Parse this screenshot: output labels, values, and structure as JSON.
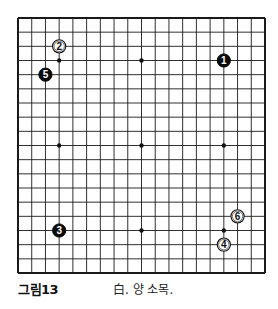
{
  "board": {
    "size": 19,
    "origin": {
      "x": 18,
      "y": 18
    },
    "end": {
      "x": 265,
      "y": 273
    },
    "line_color": "#1a1a1a",
    "background": "#ffffff",
    "star_points": [
      [
        3,
        3
      ],
      [
        3,
        9
      ],
      [
        3,
        15
      ],
      [
        9,
        3
      ],
      [
        9,
        9
      ],
      [
        9,
        15
      ],
      [
        15,
        3
      ],
      [
        15,
        9
      ],
      [
        15,
        15
      ]
    ],
    "stones": [
      {
        "number": "1",
        "color": "black",
        "col": 15,
        "row": 3
      },
      {
        "number": "2",
        "color": "white",
        "col": 3,
        "row": 2
      },
      {
        "number": "3",
        "color": "black",
        "col": 3,
        "row": 15
      },
      {
        "number": "4",
        "color": "white",
        "col": 15,
        "row": 16
      },
      {
        "number": "5",
        "color": "black",
        "col": 2,
        "row": 4
      },
      {
        "number": "6",
        "color": "white",
        "col": 16,
        "row": 14
      }
    ]
  },
  "caption": {
    "figure_label": "그림13",
    "text": "白. 양 소목."
  }
}
